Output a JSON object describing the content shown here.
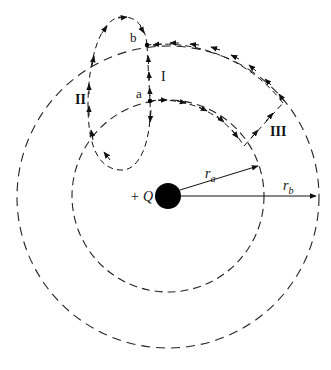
{
  "diagram": {
    "charge_label": "+ Q",
    "radius_a_label": "r",
    "radius_a_sub": "a",
    "radius_b_label": "r",
    "radius_b_sub": "b",
    "point_a_label": "a",
    "point_b_label": "b",
    "path_I_label": "I",
    "path_II_label": "II",
    "path_III_label": "III",
    "colors": {
      "ink": "#111111",
      "background": "#ffffff"
    }
  }
}
